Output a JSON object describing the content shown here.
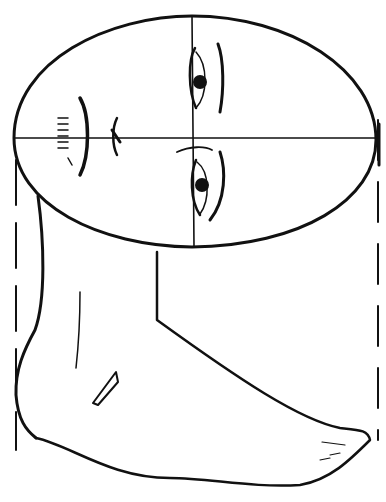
{
  "image": {
    "description": "Pencil sketch: head oval divided by crosshair with rotated facial features (eyes, nose, mouth) above a side-view foot, framed by dashed vertical guide lines",
    "stroke_color": "#111111",
    "background_color": "#ffffff"
  },
  "elements": {
    "head_oval": "head-oval",
    "crosshair": "crosshair-guides",
    "eyes": [
      "upper-eye",
      "lower-eye"
    ],
    "nose": "nose",
    "mouth": "mouth",
    "foot": "foot",
    "guides": [
      "left-dashed-guide",
      "right-dashed-guide"
    ]
  }
}
